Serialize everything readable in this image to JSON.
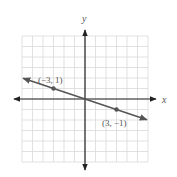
{
  "chart_data": {
    "type": "line",
    "title": "",
    "xlabel": "x",
    "ylabel": "y",
    "xlim": [
      -6,
      6
    ],
    "ylim": [
      -6,
      6
    ],
    "grid": true,
    "grid_step": 1,
    "legend": null,
    "series": [
      {
        "name": "line",
        "equation": "y = -x/3",
        "x": [
          -5.9,
          5.9
        ],
        "y": [
          1.967,
          -1.967
        ],
        "arrows_both_ends": true,
        "color": "#555555"
      }
    ],
    "points": [
      {
        "x": -3,
        "y": 1,
        "label": "(−3, 1)"
      },
      {
        "x": 3,
        "y": -1,
        "label": "(3, −1)"
      }
    ],
    "annotations": [
      "(−3, 1)",
      "(3, −1)"
    ]
  },
  "labels": {
    "x_axis": "x",
    "y_axis": "y",
    "point_a": "(−3, 1)",
    "point_b": "(3, −1)"
  },
  "colors": {
    "grid": "#d9d9d9",
    "axis": "#222222",
    "line": "#555555",
    "point": "#555555",
    "text": "#555555"
  }
}
